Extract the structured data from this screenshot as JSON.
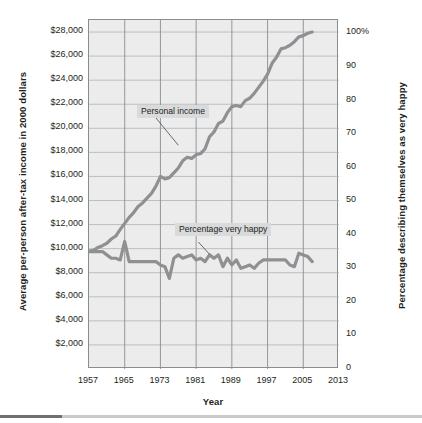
{
  "chart_data": {
    "type": "line",
    "title": "",
    "xlabel": "Year",
    "ylabel_left": "Average per-person after-tax income in 2000 dollars",
    "ylabel_right": "Percentage describing themselves as very happy",
    "xlim": [
      1957,
      2013
    ],
    "xticks": [
      "1957",
      "1965",
      "1973",
      "1981",
      "1989",
      "1997",
      "2005",
      "2013"
    ],
    "xtick_values": [
      1957,
      1965,
      1973,
      1981,
      1989,
      1997,
      2005,
      2013
    ],
    "ylim_left": [
      0,
      29000
    ],
    "yticks_left": [
      "$2,000",
      "$4,000",
      "$6,000",
      "$8,000",
      "$10,000",
      "$12,000",
      "$14,000",
      "$16,000",
      "$18,000",
      "$20,000",
      "$22,000",
      "$24,000",
      "$26,000",
      "$28,000"
    ],
    "ytick_values_left": [
      2000,
      4000,
      6000,
      8000,
      10000,
      12000,
      14000,
      16000,
      18000,
      20000,
      22000,
      24000,
      26000,
      28000
    ],
    "ylim_right": [
      0,
      104
    ],
    "yticks_right": [
      "0",
      "10",
      "20",
      "30",
      "40",
      "50",
      "60",
      "70",
      "80",
      "90",
      "100%"
    ],
    "ytick_values_right": [
      0,
      10,
      20,
      30,
      40,
      50,
      60,
      70,
      80,
      90,
      100
    ],
    "grid": true,
    "legend_position": "inline-annotations",
    "annotations": [
      {
        "text": "Personal income",
        "target_x": 1977,
        "target_y_left": 18600
      },
      {
        "text": "Percentage very happy",
        "target_x": 1984,
        "target_y_right": 33
      }
    ],
    "series": [
      {
        "name": "Personal income",
        "axis": "left",
        "color": "#8e9092",
        "units": "2000 dollars",
        "x": [
          1957,
          1958,
          1959,
          1960,
          1961,
          1962,
          1963,
          1964,
          1965,
          1966,
          1967,
          1968,
          1969,
          1970,
          1971,
          1972,
          1973,
          1974,
          1975,
          1976,
          1977,
          1978,
          1979,
          1980,
          1981,
          1982,
          1983,
          1984,
          1985,
          1986,
          1987,
          1988,
          1989,
          1990,
          1991,
          1992,
          1993,
          1994,
          1995,
          1996,
          1997,
          1998,
          1999,
          2000,
          2001,
          2002,
          2003,
          2004,
          2005,
          2006,
          2007
        ],
        "values": [
          9800,
          9850,
          10100,
          10250,
          10450,
          10800,
          11050,
          11600,
          12100,
          12600,
          13000,
          13500,
          13800,
          14200,
          14600,
          15200,
          16000,
          15800,
          15900,
          16300,
          16700,
          17300,
          17600,
          17500,
          17800,
          17900,
          18300,
          19300,
          19700,
          20400,
          20600,
          21300,
          21800,
          21900,
          21800,
          22300,
          22500,
          22900,
          23400,
          23900,
          24500,
          25400,
          25900,
          26600,
          26700,
          26900,
          27200,
          27600,
          27700,
          27900,
          28000
        ]
      },
      {
        "name": "Percentage very happy",
        "axis": "right",
        "color": "#8e9092",
        "units": "percent",
        "x": [
          1957,
          1958,
          1959,
          1960,
          1961,
          1962,
          1963,
          1964,
          1965,
          1966,
          1967,
          1968,
          1969,
          1970,
          1971,
          1972,
          1973,
          1974,
          1975,
          1976,
          1977,
          1978,
          1979,
          1980,
          1981,
          1982,
          1983,
          1984,
          1985,
          1986,
          1987,
          1988,
          1989,
          1990,
          1991,
          1992,
          1993,
          1994,
          1995,
          1996,
          1997,
          1998,
          1999,
          2000,
          2001,
          2002,
          2003,
          2004,
          2005,
          2006,
          2007
        ],
        "values": [
          35,
          35,
          35,
          35,
          34,
          33,
          33,
          32.5,
          38,
          32,
          32,
          32,
          32,
          32,
          32,
          32,
          31,
          30.5,
          27,
          33,
          34,
          33,
          33.5,
          34,
          32.5,
          33,
          32,
          34,
          33,
          34,
          30.5,
          33,
          31,
          32.5,
          30,
          30.5,
          31,
          30,
          31.5,
          32.5,
          32.5,
          32.5,
          32.5,
          32.5,
          32.5,
          31,
          30.5,
          34.5,
          34,
          33.5,
          32
        ]
      }
    ]
  },
  "axes": {
    "left_title": "Average per-person after-tax income in 2000 dollars",
    "right_title": "Percentage describing themselves as very happy",
    "bottom_title": "Year"
  }
}
